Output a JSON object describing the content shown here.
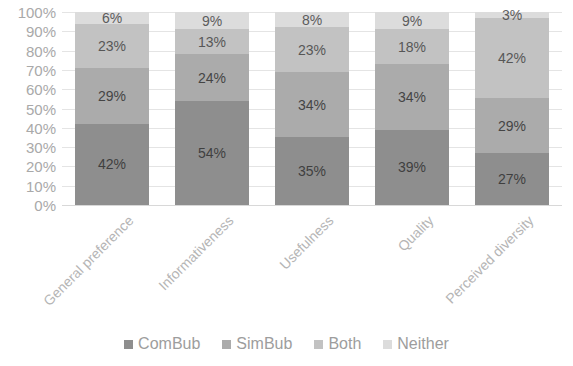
{
  "chart_data": {
    "type": "bar",
    "title": "",
    "subtitle": "",
    "xlabel": "",
    "ylabel": "",
    "stacked": true,
    "stack_mode": "percent",
    "orientation": "vertical",
    "grid": true,
    "legend_position": "bottom",
    "ylim": [
      0,
      100
    ],
    "yticks": [
      "0%",
      "10%",
      "20%",
      "30%",
      "40%",
      "50%",
      "60%",
      "70%",
      "80%",
      "90%",
      "100%"
    ],
    "ytick_values": [
      0,
      10,
      20,
      30,
      40,
      50,
      60,
      70,
      80,
      90,
      100
    ],
    "categories": [
      "General preference",
      "Informativeness",
      "Usefulness",
      "Quality",
      "Perceived diversity"
    ],
    "series": [
      {
        "name": "ComBub",
        "color": "#8e8e8e",
        "values": [
          42,
          54,
          35,
          39,
          27
        ],
        "labels": [
          "42%",
          "54%",
          "35%",
          "39%",
          "27%"
        ]
      },
      {
        "name": "SimBub",
        "color": "#ababab",
        "values": [
          29,
          24,
          34,
          34,
          29
        ],
        "labels": [
          "29%",
          "24%",
          "34%",
          "34%",
          "29%"
        ]
      },
      {
        "name": "Both",
        "color": "#c2c2c2",
        "values": [
          23,
          13,
          23,
          18,
          42
        ],
        "labels": [
          "23%",
          "13%",
          "23%",
          "18%",
          "42%"
        ]
      },
      {
        "name": "Neither",
        "color": "#dcdcdc",
        "values": [
          6,
          9,
          8,
          9,
          3
        ],
        "labels": [
          "6%",
          "9%",
          "8%",
          "9%",
          "3%"
        ]
      }
    ]
  },
  "legend": {
    "items": [
      {
        "label": "ComBub",
        "color": "#8e8e8e"
      },
      {
        "label": "SimBub",
        "color": "#ababab"
      },
      {
        "label": "Both",
        "color": "#c2c2c2"
      },
      {
        "label": "Neither",
        "color": "#dcdcdc"
      }
    ]
  },
  "style": {
    "background": "#ffffff",
    "gridline_color": "#e4e4e4",
    "axis_text_color": "#a9a9a9",
    "category_text_color": "#b5b5b5",
    "legend_text_color": "#9d9d9d",
    "data_label_color": "#3f3f3f"
  }
}
